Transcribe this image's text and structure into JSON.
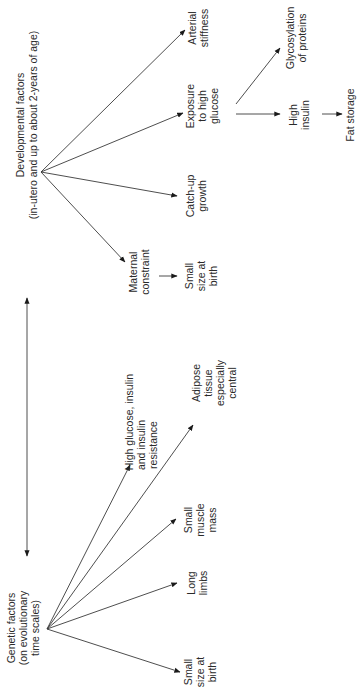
{
  "diagram": {
    "orientation": "rotated-90-ccw",
    "relation_arrow": "bidirectional between genetic and developmental factors",
    "genetic": {
      "title": "Genetic factors",
      "subtitle_1": "(on evolutionary",
      "subtitle_2": "time scales)",
      "outcomes": [
        {
          "lines": [
            "Small",
            "size at",
            "birth"
          ]
        },
        {
          "lines": [
            "Long",
            "limbs"
          ]
        },
        {
          "lines": [
            "Small",
            "muscle",
            "mass"
          ]
        },
        {
          "lines": [
            "High glucose, insulin",
            "and insulin",
            "resistance"
          ]
        },
        {
          "lines": [
            "Adipose",
            "tissue",
            "especially",
            "central"
          ]
        }
      ]
    },
    "developmental": {
      "title": "Developmental factors",
      "subtitle": "(in-utero and up to about 2-years of age)",
      "outcomes": [
        {
          "lines": [
            "Maternal",
            "constraint"
          ]
        },
        {
          "lines": [
            "Catch-up",
            "growth"
          ]
        },
        {
          "lines": [
            "Exposure",
            "to high",
            "glucose"
          ]
        },
        {
          "lines": [
            "Arterial",
            "stiffness"
          ]
        }
      ],
      "maternal_result": {
        "lines": [
          "Small",
          "size at",
          "birth"
        ]
      },
      "glucose_results": [
        {
          "lines": [
            "Glycosylation",
            "of proteins"
          ]
        },
        {
          "lines": [
            "High",
            "insulin"
          ]
        }
      ],
      "insulin_result": {
        "lines": [
          "Fat storage"
        ]
      }
    }
  }
}
